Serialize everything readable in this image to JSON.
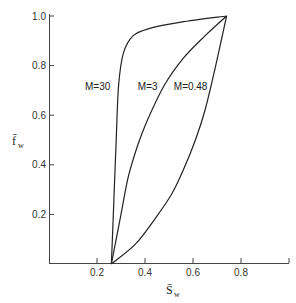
{
  "chart_data": {
    "type": "line",
    "title": "",
    "xlabel": "S̄w",
    "ylabel": "f̄w",
    "xlabel_main": "S̄",
    "xlabel_sub": "w",
    "ylabel_main": "f̄",
    "ylabel_sub": "w",
    "xlim": [
      0,
      1.0
    ],
    "ylim": [
      0,
      1.0
    ],
    "x_ticks": [
      0.2,
      0.4,
      0.6,
      0.8,
      1.0
    ],
    "x_tick_labels": [
      "0.2",
      "0.4",
      "0.6",
      "0.8",
      ""
    ],
    "y_ticks": [
      0.2,
      0.4,
      0.6,
      0.8,
      1.0
    ],
    "y_tick_labels": [
      "0.2",
      "0.4",
      "0.6",
      "0.8",
      "1.0"
    ],
    "grid": false,
    "legend": "inline curve labels",
    "series": [
      {
        "name": "M=30",
        "label": "M=30",
        "x": [
          0.26,
          0.27,
          0.28,
          0.29,
          0.31,
          0.35,
          0.42,
          0.55,
          0.74
        ],
        "y": [
          0.0,
          0.25,
          0.5,
          0.72,
          0.85,
          0.92,
          0.95,
          0.975,
          1.0
        ]
      },
      {
        "name": "M=3",
        "label": "M=3",
        "x": [
          0.26,
          0.3,
          0.33,
          0.37,
          0.41,
          0.48,
          0.56,
          0.65,
          0.74
        ],
        "y": [
          0.0,
          0.2,
          0.35,
          0.48,
          0.58,
          0.72,
          0.83,
          0.92,
          1.0
        ]
      },
      {
        "name": "M=0.48",
        "label": "M=0.48",
        "x": [
          0.26,
          0.36,
          0.44,
          0.51,
          0.56,
          0.61,
          0.65,
          0.69,
          0.74
        ],
        "y": [
          0.0,
          0.08,
          0.18,
          0.28,
          0.38,
          0.5,
          0.62,
          0.78,
          1.0
        ]
      }
    ],
    "annotations": [
      {
        "text": "M=30",
        "x": 0.15,
        "y": 0.7
      },
      {
        "text": "M=3",
        "x": 0.37,
        "y": 0.7
      },
      {
        "text": "M=0.48",
        "x": 0.52,
        "y": 0.7
      }
    ]
  }
}
